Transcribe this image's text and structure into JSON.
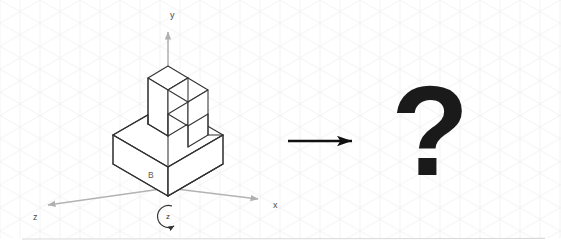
{
  "figure": {
    "type": "isometric-rotation-problem",
    "background_color": "#ffffff",
    "grid": {
      "name": "isometric-grid",
      "color": "#f4f4f6",
      "spacing_px": 40,
      "visible": true
    },
    "separator_line": {
      "color": "#d9d9d9",
      "y": 239
    }
  },
  "axes": {
    "color": "#b3b3b3",
    "origin": {
      "x": 168,
      "y": 188
    },
    "items": [
      {
        "name": "axis-y",
        "label": "y",
        "direction": "up",
        "label_x": 170,
        "label_y": 18
      },
      {
        "name": "axis-x",
        "label": "x",
        "direction": "down-right",
        "label_x": 273,
        "label_y": 208
      },
      {
        "name": "axis-z",
        "label": "z",
        "direction": "down-left",
        "label_x": 33,
        "label_y": 220
      }
    ]
  },
  "rotation_symbol": {
    "name": "rotation-about-z",
    "label": "z",
    "center_x": 169,
    "center_y": 216,
    "radius": 11,
    "direction": "clockwise",
    "color": "#333333"
  },
  "object": {
    "name": "isometric-l-block",
    "stroke_color": "#333333",
    "fill_color": "#ffffff",
    "face_labels": [
      {
        "name": "face-label-B",
        "text": "B",
        "x": 148,
        "y": 178
      }
    ]
  },
  "transform_arrow": {
    "name": "transform-arrow",
    "direction": "right",
    "color": "#111111",
    "x1": 288,
    "x2": 353,
    "y": 141
  },
  "result": {
    "name": "unknown-result",
    "text": "?",
    "x": 430,
    "y": 175,
    "color": "#1a1a1a"
  }
}
